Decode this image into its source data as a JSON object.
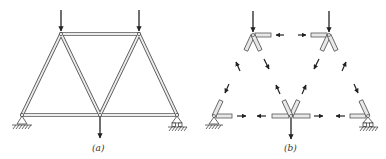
{
  "figure": {
    "panels": [
      {
        "id": "a",
        "label": "(a)",
        "description": "Truss with two top loads and one bottom-center load, pin support left, roller support right"
      },
      {
        "id": "b",
        "label": "(b)",
        "description": "Free-body diagrams of joints showing member force arrows"
      }
    ],
    "colors": {
      "member_fill": "#e6e6e6",
      "member_stroke": "#555555",
      "arrow": "#222222",
      "hatch": "#444444"
    }
  }
}
